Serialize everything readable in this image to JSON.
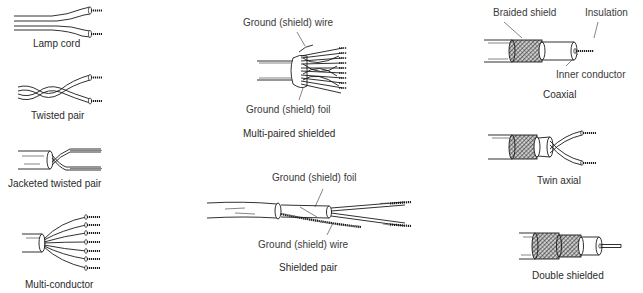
{
  "diagram": {
    "items": [
      {
        "id": "lamp-cord",
        "caption": "Lamp cord"
      },
      {
        "id": "twisted-pair",
        "caption": "Twisted pair"
      },
      {
        "id": "jacketed-twisted-pair",
        "caption": "Jacketed twisted pair"
      },
      {
        "id": "multi-conductor",
        "caption": "Multi-conductor"
      },
      {
        "id": "multi-paired-shielded",
        "caption": "Multi-paired shielded",
        "callouts": [
          "Ground (shield) wire",
          "Ground (shield) foil"
        ]
      },
      {
        "id": "shielded-pair",
        "caption": "Shielded pair",
        "callouts": [
          "Ground (shield) foil",
          "Ground (shield) wire"
        ]
      },
      {
        "id": "coaxial",
        "caption": "Coaxial",
        "callouts": [
          "Braided shield",
          "Insulation",
          "Inner conductor"
        ]
      },
      {
        "id": "twin-axial",
        "caption": "Twin axial"
      },
      {
        "id": "double-shielded",
        "caption": "Double shielded"
      }
    ]
  },
  "style": {
    "background": "#ffffff",
    "line_color": "#1a1a1a",
    "text_color": "#2a2a2a"
  }
}
